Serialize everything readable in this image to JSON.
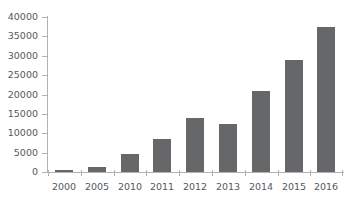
{
  "chart_data": {
    "type": "bar",
    "title": "",
    "subtitle": "",
    "xlabel": "",
    "ylabel": "",
    "categories": [
      "2000",
      "2005",
      "2010",
      "2011",
      "2012",
      "2013",
      "2014",
      "2015",
      "2016"
    ],
    "values": [
      500,
      1400,
      4700,
      8600,
      14000,
      12300,
      20900,
      28900,
      37500
    ],
    "series": [
      {
        "name": "",
        "values": [
          500,
          1400,
          4700,
          8600,
          14000,
          12300,
          20900,
          28900,
          37500
        ]
      }
    ],
    "ylim": [
      0,
      40000
    ],
    "y_ticks": [
      0,
      5000,
      10000,
      15000,
      20000,
      25000,
      30000,
      35000,
      40000
    ],
    "y_tick_labels": [
      "0",
      "5000",
      "10000",
      "15000",
      "20000",
      "25000",
      "30000",
      "35000",
      "40000"
    ],
    "x_tick_labels": [
      "2000",
      "2005",
      "2010",
      "2011",
      "2012",
      "2013",
      "2014",
      "2015",
      "2016"
    ],
    "grid": false,
    "legend": false,
    "legend_position": "none",
    "bar_color": "#666769",
    "axis_color": "#b2b2b2",
    "tick_label_color": "#55585c",
    "background_color": "#ffffff"
  }
}
